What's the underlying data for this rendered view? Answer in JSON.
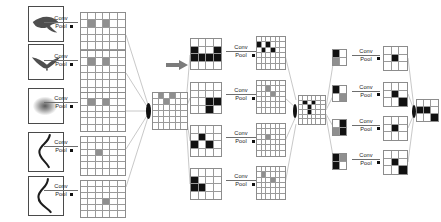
{
  "diagram": {
    "operation_label_top": "Conv",
    "operation_label_bottom": "Pool",
    "colors": {
      "ink": "#111111",
      "grid_line": "#9a9a9a",
      "grid_border": "#8c8c8c",
      "wire": "#9a9a9a",
      "photo_border": "#4a4a4a",
      "active_gray": "#8f8f8f",
      "active_dark": "#111111",
      "page_background": "#ffffff"
    },
    "stage_count": 4,
    "inputs": [
      {
        "name": "bird-silhouette-1",
        "icon": "bird-flying-icon"
      },
      {
        "name": "bird-silhouette-2",
        "icon": "bird-gliding-icon"
      },
      {
        "name": "blur-blob",
        "icon": "gaussian-blob-icon"
      },
      {
        "name": "curve-stroke-1",
        "icon": "s-curve-icon"
      },
      {
        "name": "curve-stroke-2",
        "icon": "s-curve-tall-icon"
      }
    ],
    "stage1_maps": [
      {
        "name": "feature-map-1",
        "rows": 6,
        "cols": 6,
        "active": [
          [
            1,
            1
          ],
          [
            1,
            3
          ]
        ],
        "tone": "gray"
      },
      {
        "name": "feature-map-2",
        "rows": 6,
        "cols": 6,
        "active": [
          [
            1,
            1
          ],
          [
            1,
            3
          ]
        ],
        "tone": "gray"
      },
      {
        "name": "feature-map-3",
        "rows": 6,
        "cols": 6,
        "active": [
          [
            1,
            1
          ],
          [
            1,
            3
          ]
        ],
        "tone": "gray"
      },
      {
        "name": "feature-map-4",
        "rows": 6,
        "cols": 6,
        "active": [
          [
            2,
            2
          ]
        ],
        "tone": "gray"
      },
      {
        "name": "feature-map-5",
        "rows": 6,
        "cols": 6,
        "active": [
          [
            3,
            3
          ]
        ],
        "tone": "gray"
      }
    ],
    "stage2_pooled": {
      "name": "pooled-map-center",
      "rows": 6,
      "cols": 6,
      "active": [
        [
          0,
          1
        ],
        [
          0,
          3
        ],
        [
          1,
          2
        ]
      ],
      "tone": "gray"
    },
    "stage2_maps": [
      {
        "name": "feature-map-6",
        "rows": 4,
        "cols": 4,
        "active": [
          [
            1,
            0
          ],
          [
            1,
            3
          ],
          [
            2,
            0
          ],
          [
            2,
            1
          ],
          [
            2,
            2
          ],
          [
            2,
            3
          ]
        ],
        "tone": "dark"
      },
      {
        "name": "feature-map-7",
        "rows": 4,
        "cols": 4,
        "active": [
          [
            2,
            2
          ],
          [
            2,
            3
          ],
          [
            3,
            2
          ]
        ],
        "tone": "dark"
      },
      {
        "name": "feature-map-8",
        "rows": 4,
        "cols": 4,
        "active": [
          [
            1,
            1
          ],
          [
            2,
            0
          ],
          [
            2,
            2
          ]
        ],
        "tone": "dark"
      },
      {
        "name": "feature-map-9",
        "rows": 4,
        "cols": 4,
        "active": [
          [
            1,
            0
          ],
          [
            2,
            0
          ],
          [
            2,
            1
          ]
        ],
        "tone": "dark"
      }
    ],
    "stage3_maps": [
      {
        "name": "feature-map-10",
        "rows": 6,
        "cols": 6,
        "active": [
          [
            1,
            0
          ],
          [
            1,
            2
          ],
          [
            2,
            1
          ],
          [
            2,
            3
          ]
        ],
        "tone": "dark"
      },
      {
        "name": "feature-map-11",
        "rows": 6,
        "cols": 6,
        "active": [
          [
            1,
            2
          ],
          [
            2,
            3
          ]
        ],
        "tone": "gray"
      },
      {
        "name": "feature-map-12",
        "rows": 6,
        "cols": 6,
        "active": [
          [
            2,
            2
          ]
        ],
        "tone": "gray"
      },
      {
        "name": "feature-map-13",
        "rows": 6,
        "cols": 6,
        "active": [
          [
            1,
            1
          ],
          [
            2,
            3
          ]
        ],
        "tone": "gray"
      }
    ],
    "stage3_pooled": {
      "name": "pooled-map-right",
      "rows": 6,
      "cols": 6,
      "active": [
        [
          1,
          1
        ],
        [
          1,
          3
        ],
        [
          2,
          2
        ],
        [
          3,
          2
        ]
      ],
      "tone": "dark"
    },
    "stage4_tiles": [
      {
        "name": "tile-1",
        "rows": 2,
        "cols": 2,
        "active": [
          [
            0,
            0
          ],
          [
            1,
            0
          ]
        ],
        "tone": "mixed"
      },
      {
        "name": "tile-2",
        "rows": 2,
        "cols": 2,
        "active": [
          [
            0,
            0
          ],
          [
            1,
            1
          ]
        ],
        "tone": "mixed"
      },
      {
        "name": "tile-3",
        "rows": 2,
        "cols": 2,
        "active": [
          [
            0,
            1
          ],
          [
            1,
            0
          ],
          [
            1,
            1
          ]
        ],
        "tone": "mixed"
      },
      {
        "name": "tile-4",
        "rows": 2,
        "cols": 2,
        "active": [
          [
            0,
            0
          ],
          [
            0,
            1
          ],
          [
            1,
            0
          ]
        ],
        "tone": "mixed"
      }
    ],
    "stage4_maps": [
      {
        "name": "feature-map-14",
        "rows": 3,
        "cols": 3,
        "active": [
          [
            1,
            1
          ]
        ],
        "tone": "dark"
      },
      {
        "name": "feature-map-15",
        "rows": 3,
        "cols": 3,
        "active": [
          [
            1,
            1
          ],
          [
            2,
            2
          ]
        ],
        "tone": "dark"
      },
      {
        "name": "feature-map-16",
        "rows": 3,
        "cols": 3,
        "active": [
          [
            1,
            1
          ]
        ],
        "tone": "dark"
      },
      {
        "name": "feature-map-17",
        "rows": 3,
        "cols": 3,
        "active": [
          [
            1,
            1
          ],
          [
            2,
            2
          ]
        ],
        "tone": "dark"
      }
    ],
    "output_map": {
      "name": "output-feature-map",
      "rows": 3,
      "cols": 3,
      "active": [
        [
          1,
          0
        ],
        [
          1,
          1
        ],
        [
          2,
          2
        ]
      ],
      "tone": "dark"
    }
  }
}
